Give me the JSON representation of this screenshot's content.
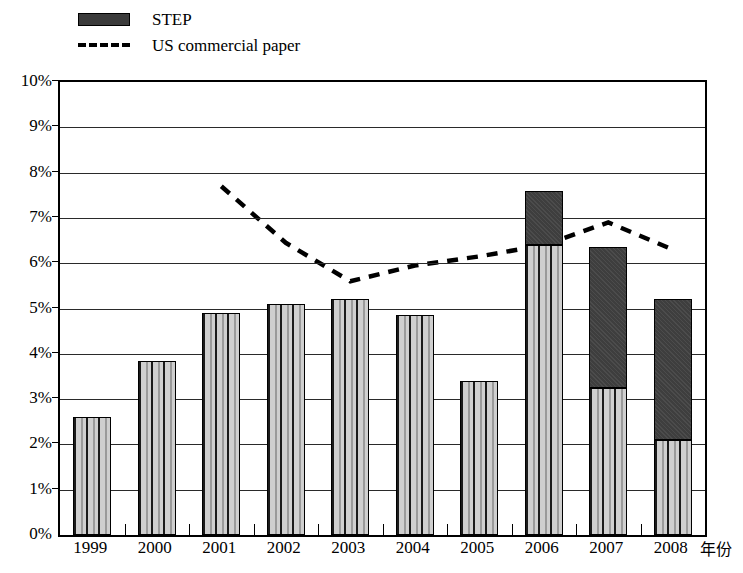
{
  "legend": {
    "items": [
      {
        "key": "step",
        "label": "STEP",
        "marker": "filled-bar-swatch",
        "color": "#3e3e3e"
      },
      {
        "key": "us_commercial_paper",
        "label": "US commercial paper",
        "marker": "dashed-line-swatch",
        "color": "#000000"
      }
    ]
  },
  "axes": {
    "x_title": "年份",
    "y_ticks": [
      "0%",
      "1%",
      "2%",
      "3%",
      "4%",
      "5%",
      "6%",
      "7%",
      "8%",
      "9%",
      "10%"
    ],
    "x_ticks": [
      "1999",
      "2000",
      "2001",
      "2002",
      "2003",
      "2004",
      "2005",
      "2006",
      "2007",
      "2008"
    ]
  },
  "chart_data": {
    "type": "bar",
    "title": "",
    "subtitle": "",
    "xlabel": "年份",
    "ylabel": "",
    "ylim": [
      0,
      10
    ],
    "ytick_step": 1,
    "ytick_format": "percent",
    "grid": true,
    "legend_position": "top-left",
    "categories": [
      "1999",
      "2000",
      "2001",
      "2002",
      "2003",
      "2004",
      "2005",
      "2006",
      "2007",
      "2008"
    ],
    "stacked": true,
    "series": [
      {
        "name": "Base (hatched)",
        "type": "bar",
        "stack": "total",
        "pattern": "vertical-stripes",
        "values": [
          2.6,
          3.85,
          4.9,
          5.1,
          5.2,
          4.85,
          3.4,
          6.4,
          3.25,
          2.1
        ]
      },
      {
        "name": "STEP",
        "type": "bar",
        "stack": "total",
        "color": "#3e3e3e",
        "values": [
          0,
          0,
          0,
          0,
          0,
          0,
          0,
          1.2,
          3.1,
          3.1
        ]
      },
      {
        "name": "US commercial paper",
        "type": "line",
        "style": "dashed",
        "color": "#000000",
        "x": [
          "2001",
          "2002",
          "2003",
          "2004",
          "2005",
          "2006",
          "2007",
          "2008"
        ],
        "values": [
          7.7,
          6.45,
          5.6,
          5.95,
          6.15,
          6.4,
          6.9,
          6.3
        ]
      }
    ],
    "bar_totals": [
      2.6,
      3.85,
      4.9,
      5.1,
      5.2,
      4.85,
      3.4,
      7.6,
      6.35,
      5.2
    ]
  }
}
